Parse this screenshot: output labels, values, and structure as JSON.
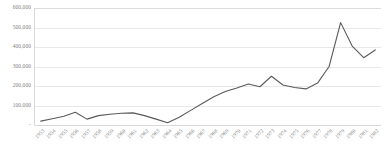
{
  "chart_data": {
    "type": "line",
    "title": "",
    "subtitle": "",
    "xlabel": "",
    "ylabel": "",
    "legend": [],
    "legend_position": "none",
    "grid": true,
    "ylim": [
      0,
      600000
    ],
    "ytick_labels": [
      "600,000",
      "500,000",
      "400,000",
      "300,000",
      "200,000",
      "100,000",
      "-"
    ],
    "ytick_values": [
      600000,
      500000,
      400000,
      300000,
      200000,
      100000,
      0
    ],
    "categories": [
      "1953",
      "1954",
      "1955",
      "1956",
      "1957",
      "1958",
      "1959",
      "1960",
      "1961",
      "1962",
      "1963",
      "1964",
      "1965",
      "1966",
      "1967",
      "1968",
      "1969",
      "1970",
      "1971",
      "1972",
      "1973",
      "1974",
      "1975",
      "1976",
      "1977",
      "1978",
      "1979",
      "1980",
      "1981",
      "1982"
    ],
    "values": [
      20000,
      32000,
      45000,
      65000,
      30000,
      48000,
      55000,
      60000,
      62000,
      48000,
      30000,
      12000,
      40000,
      75000,
      110000,
      145000,
      172000,
      190000,
      210000,
      196000,
      250000,
      205000,
      192000,
      185000,
      215000,
      300000,
      525000,
      405000,
      345000,
      385000
    ],
    "series": [
      {
        "name": "series-1",
        "color": "#5a5a5a",
        "values": [
          20000,
          32000,
          45000,
          65000,
          30000,
          48000,
          55000,
          60000,
          62000,
          48000,
          30000,
          12000,
          40000,
          75000,
          110000,
          145000,
          172000,
          190000,
          210000,
          196000,
          250000,
          205000,
          192000,
          185000,
          215000,
          300000,
          525000,
          405000,
          345000,
          385000
        ]
      }
    ],
    "colors": {
      "line": "#5a5a5a",
      "gridline": "#e8e8e8",
      "axis": "#d9d9d9",
      "tick_text": "#808080",
      "background": "#ffffff"
    }
  }
}
